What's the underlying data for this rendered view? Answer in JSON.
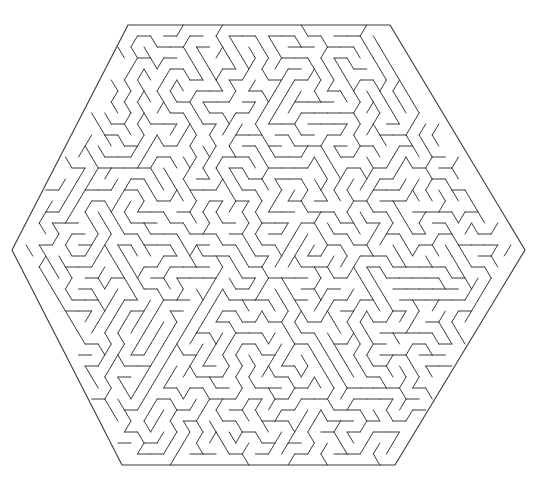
{
  "document": {
    "kind": "maze-puzzle",
    "title": "Hexagonal Triangular Maze",
    "background_color": "#ffffff",
    "canvas": {
      "width": 541,
      "height": 498
    }
  },
  "maze": {
    "shape": "hexagon",
    "cell_shape": "triangle",
    "line_color": "#3a3a3a",
    "line_width": 1,
    "border_width": 1.1,
    "rows": 40,
    "row_height": 11,
    "half_cell_width": 6.55,
    "seed": 20240917,
    "center": {
      "x": 268.5,
      "y": 245
    },
    "vertices": [
      {
        "x": 128,
        "y": 25
      },
      {
        "x": 390,
        "y": 25
      },
      {
        "x": 525,
        "y": 250
      },
      {
        "x": 395,
        "y": 465
      },
      {
        "x": 122,
        "y": 465
      },
      {
        "x": 12,
        "y": 250
      }
    ],
    "openings": []
  },
  "chart_data": {
    "type": "table",
    "categories": [],
    "values": []
  }
}
